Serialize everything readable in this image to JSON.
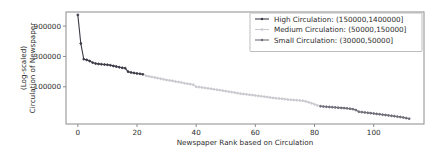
{
  "chart_data": {
    "type": "line",
    "title": "",
    "xlabel": "Newspaper Rank based on Circulation",
    "ylabel_line1": "(Log-scaled)",
    "ylabel_line2": "Circulation of Newspaper",
    "yscale": "log",
    "xlim": [
      -4,
      117
    ],
    "ylim": [
      26000,
      1500000
    ],
    "xticks": [
      0,
      20,
      40,
      60,
      80,
      100
    ],
    "xticklabels": [
      "0",
      "20",
      "40",
      "60",
      "80",
      "100"
    ],
    "yticks": [
      100000,
      300000,
      900000
    ],
    "yticklabels": [
      "100000",
      "300000",
      "900000"
    ],
    "grid": false,
    "legend_position": "upper right",
    "series": [
      {
        "name": "High Circulation: (150000,1400000]",
        "color": "#3b3b47",
        "marker": "point",
        "x": [
          0,
          1,
          2,
          3,
          4,
          5,
          6,
          7,
          8,
          9,
          10,
          11,
          12,
          13,
          14,
          15,
          16,
          17,
          18,
          19,
          20,
          21,
          22
        ],
        "y": [
          1350000,
          480000,
          272000,
          265000,
          254000,
          240000,
          232000,
          229000,
          226000,
          224000,
          222000,
          218000,
          213000,
          208000,
          203000,
          199000,
          196000,
          173000,
          168000,
          165000,
          162000,
          160000,
          157000
        ]
      },
      {
        "name": "Medium Circulation: (50000,150000]",
        "color": "#c9c9cf",
        "marker": "point",
        "x": [
          23,
          24,
          25,
          26,
          27,
          28,
          29,
          30,
          31,
          32,
          33,
          34,
          35,
          36,
          37,
          38,
          39,
          40,
          41,
          42,
          43,
          44,
          45,
          46,
          47,
          48,
          49,
          50,
          51,
          52,
          53,
          54,
          55,
          56,
          57,
          58,
          59,
          60,
          61,
          62,
          63,
          64,
          65,
          66,
          67,
          68,
          69,
          70,
          71,
          72,
          73,
          74,
          75,
          76,
          77,
          78,
          79,
          80,
          81
        ],
        "y": [
          149000,
          146000,
          143000,
          140000,
          137000,
          134000,
          131000,
          128000,
          126000,
          124000,
          121000,
          119000,
          117000,
          114000,
          112000,
          110000,
          108000,
          100000,
          99000,
          97500,
          96000,
          94500,
          93000,
          91500,
          90000,
          88500,
          87000,
          85500,
          84000,
          82500,
          81000,
          79500,
          78000,
          77000,
          76000,
          75000,
          74000,
          73000,
          72000,
          71000,
          70000,
          69000,
          68000,
          67000,
          66000,
          65500,
          65000,
          64000,
          63000,
          62500,
          62000,
          61500,
          61000,
          60500,
          59000,
          57000,
          55000,
          53000,
          51000
        ]
      },
      {
        "name": "Small Circulation: (30000,50000]",
        "color": "#6e6e78",
        "marker": "point",
        "x": [
          82,
          83,
          84,
          85,
          86,
          87,
          88,
          89,
          90,
          91,
          92,
          93,
          94,
          95,
          96,
          97,
          98,
          99,
          100,
          101,
          102,
          103,
          104,
          105,
          106,
          107,
          108,
          109,
          110,
          111,
          112
        ],
        "y": [
          49500,
          49000,
          48600,
          48200,
          47800,
          47400,
          47000,
          46600,
          46200,
          45800,
          45200,
          44500,
          43000,
          40500,
          40000,
          39500,
          39000,
          38500,
          38000,
          37500,
          37000,
          36500,
          36000,
          35500,
          35000,
          34500,
          34000,
          33500,
          33000,
          32200,
          31500
        ]
      }
    ]
  }
}
